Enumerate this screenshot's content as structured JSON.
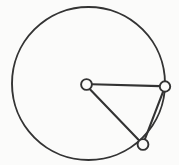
{
  "figure": {
    "title": "Circle with inscribed triangle",
    "background_color": "#fbfbfa",
    "stroke_color": "#333333",
    "node_fill_color": "#fbfbfa",
    "width": 179,
    "height": 165
  },
  "chart_data": {
    "type": "diagram",
    "subtype": "geometric-circle-with-chords",
    "title": "Circle with inscribed triangle",
    "xlabel": "",
    "ylabel": "",
    "grid": false,
    "legend": null,
    "coordinate_space": {
      "units": "pixels",
      "origin": "top-left",
      "xlim": [
        0,
        179
      ],
      "ylim": [
        0,
        165
      ]
    },
    "shapes": [
      {
        "name": "main-circle",
        "type": "circle",
        "cx": 88.5,
        "cy": 83.5,
        "r": 76.5,
        "stroke": "#333333",
        "stroke_width": 1.9,
        "fill": "none"
      }
    ],
    "nodes": [
      {
        "id": "node-center",
        "label": "",
        "cx": 86.5,
        "cy": 84.5,
        "r": 5.4,
        "on_circle": false,
        "stroke": "#333333",
        "stroke_width": 1.9,
        "fill": "#fbfbfa"
      },
      {
        "id": "node-right",
        "label": "",
        "cx": 165.0,
        "cy": 86.5,
        "r": 5.2,
        "on_circle": true,
        "stroke": "#333333",
        "stroke_width": 1.9,
        "fill": "#fbfbfa"
      },
      {
        "id": "node-bottom",
        "label": "",
        "cx": 143.0,
        "cy": 144.5,
        "r": 5.4,
        "on_circle": true,
        "stroke": "#333333",
        "stroke_width": 1.9,
        "fill": "#fbfbfa"
      }
    ],
    "edges": [
      {
        "id": "edge-center-right",
        "from": "node-center",
        "to": "node-right",
        "x1": 92.0,
        "y1": 84.2,
        "x2": 159.9,
        "y2": 86.1,
        "stroke": "#333333",
        "stroke_width": 2.1
      },
      {
        "id": "edge-center-bottom",
        "from": "node-center",
        "to": "node-bottom",
        "x1": 89.7,
        "y1": 88.9,
        "x2": 139.2,
        "y2": 140.6,
        "stroke": "#333333",
        "stroke_width": 2.1
      },
      {
        "id": "edge-right-bottom",
        "from": "node-right",
        "to": "node-bottom",
        "x1": 163.2,
        "y1": 91.4,
        "x2": 144.8,
        "y2": 139.4,
        "stroke": "#333333",
        "stroke_width": 2.1
      }
    ]
  }
}
